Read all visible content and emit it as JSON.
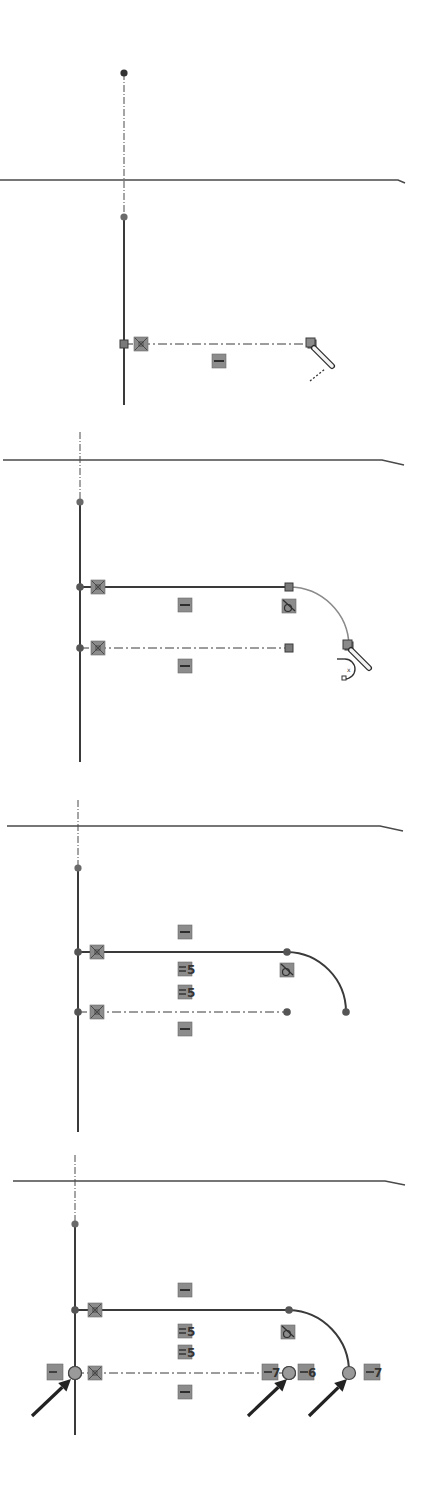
{
  "figure": {
    "colors": {
      "background": "#ffffff",
      "geometry": "#3a3a3a",
      "preview_arc": "#8a8a8a",
      "relation_box_fill": "#8c8c8c",
      "relation_box_stroke": "#6a6a6a",
      "point_fill": "#555555",
      "selected_point_fill": "#9a9a9a",
      "arrow": "#222222"
    }
  },
  "panels": [
    {
      "id": "step-1",
      "horizontal_edge": {
        "x1": 0,
        "y1": 180,
        "x2": 398,
        "y2": 180,
        "tail_x": 405,
        "tail_y": 183
      },
      "centerline": {
        "x": 124,
        "y1": 73,
        "y2": 217
      },
      "top_point": {
        "x": 124,
        "y": 73
      },
      "vertical_line": {
        "x": 124,
        "y1": 217,
        "y2": 405
      },
      "axis_point": {
        "x": 124,
        "y": 217
      },
      "rows": [
        {
          "y": 344,
          "x1": 124,
          "x2": 312,
          "style": "dashdot",
          "start_marker": "square",
          "end_marker": "square",
          "relation_box_x": 141,
          "relation": "coincident"
        }
      ],
      "arc": null,
      "glyphs": [
        {
          "x": 219,
          "y": 361,
          "type": "horizontal",
          "label": ""
        }
      ],
      "cursor": {
        "type": "pencil",
        "x": 312,
        "y": 344,
        "trail": true,
        "arc_hint": false
      }
    },
    {
      "id": "step-2",
      "horizontal_edge": {
        "x1": 3,
        "y1": 460,
        "x2": 382,
        "y2": 460,
        "tail_x": 404,
        "tail_y": 465
      },
      "centerline": {
        "x": 80,
        "y1": 432,
        "y2": 502
      },
      "top_point": null,
      "vertical_line": {
        "x": 80,
        "y1": 502,
        "y2": 762
      },
      "axis_point": {
        "x": 80,
        "y": 502
      },
      "rows": [
        {
          "y": 587,
          "x1": 80,
          "x2": 289,
          "style": "solid",
          "start_marker": "dot",
          "end_marker": "square",
          "relation_box_x": 98,
          "relation": "coincident"
        },
        {
          "y": 648,
          "x1": 80,
          "x2": 289,
          "style": "dashdot",
          "start_marker": "dot",
          "end_marker": "square",
          "relation_box_x": 98,
          "relation": "coincident"
        }
      ],
      "arc": {
        "x1": 289,
        "y1": 587,
        "x2": 349,
        "y2": 646,
        "r": 60,
        "style": "preview",
        "end_marker": "square"
      },
      "glyphs": [
        {
          "x": 185,
          "y": 605,
          "type": "horizontal",
          "label": ""
        },
        {
          "x": 289,
          "y": 606,
          "type": "tangent",
          "label": ""
        },
        {
          "x": 185,
          "y": 666,
          "type": "horizontal",
          "label": ""
        }
      ],
      "cursor": {
        "type": "pencil",
        "x": 349,
        "y": 646,
        "trail": false,
        "arc_hint": true
      }
    },
    {
      "id": "step-3",
      "horizontal_edge": {
        "x1": 7,
        "y1": 826,
        "x2": 380,
        "y2": 826,
        "tail_x": 403,
        "tail_y": 831
      },
      "centerline": {
        "x": 78,
        "y1": 800,
        "y2": 868
      },
      "top_point": null,
      "vertical_line": {
        "x": 78,
        "y1": 868,
        "y2": 1132
      },
      "axis_point": {
        "x": 78,
        "y": 868
      },
      "rows": [
        {
          "y": 952,
          "x1": 78,
          "x2": 287,
          "style": "solid",
          "start_marker": "dot",
          "end_marker": "dot",
          "relation_box_x": 97,
          "relation": "coincident"
        },
        {
          "y": 1012,
          "x1": 78,
          "x2": 287,
          "style": "dashdot",
          "start_marker": "dot",
          "end_marker": "dot",
          "relation_box_x": 97,
          "relation": "coincident"
        }
      ],
      "arc": {
        "x1": 287,
        "y1": 952,
        "x2": 346,
        "y2": 1012,
        "r": 60,
        "style": "solid",
        "end_marker": "dot"
      },
      "glyphs": [
        {
          "x": 185,
          "y": 932,
          "type": "horizontal",
          "label": ""
        },
        {
          "x": 185,
          "y": 969,
          "type": "equal",
          "label": "5"
        },
        {
          "x": 185,
          "y": 992,
          "type": "equal",
          "label": "5"
        },
        {
          "x": 287,
          "y": 970,
          "type": "tangent",
          "label": ""
        },
        {
          "x": 185,
          "y": 1029,
          "type": "horizontal",
          "label": ""
        }
      ],
      "cursor": null
    },
    {
      "id": "step-4",
      "horizontal_edge": {
        "x1": 13,
        "y1": 1181,
        "x2": 385,
        "y2": 1181,
        "tail_x": 405,
        "tail_y": 1185
      },
      "centerline": {
        "x": 75,
        "y1": 1155,
        "y2": 1224
      },
      "top_point": null,
      "vertical_line": {
        "x": 75,
        "y1": 1224,
        "y2": 1435
      },
      "axis_point": {
        "x": 75,
        "y": 1224
      },
      "rows": [
        {
          "y": 1310,
          "x1": 75,
          "x2": 289,
          "style": "solid",
          "start_marker": "dot",
          "end_marker": "dot",
          "relation_box_x": 95,
          "relation": "coincident"
        },
        {
          "y": 1373,
          "x1": 75,
          "x2": 289,
          "style": "dashdot",
          "start_marker": "selected",
          "end_marker": "selected",
          "relation_box_x": 95,
          "relation": "coincident"
        }
      ],
      "arc": {
        "x1": 289,
        "y1": 1310,
        "x2": 349,
        "y2": 1373,
        "r": 62,
        "style": "solid",
        "end_marker": "selected"
      },
      "glyphs": [
        {
          "x": 185,
          "y": 1290,
          "type": "horizontal",
          "label": ""
        },
        {
          "x": 185,
          "y": 1331,
          "type": "equal",
          "label": "5"
        },
        {
          "x": 185,
          "y": 1352,
          "type": "equal",
          "label": "5"
        },
        {
          "x": 288,
          "y": 1332,
          "type": "tangent",
          "label": ""
        },
        {
          "x": 185,
          "y": 1392,
          "type": "horizontal",
          "label": ""
        },
        {
          "x": 55,
          "y": 1372,
          "type": "horizontal-mid",
          "label": ""
        },
        {
          "x": 270,
          "y": 1372,
          "type": "horizontal-mid",
          "label": "7"
        },
        {
          "x": 306,
          "y": 1372,
          "type": "horizontal-mid",
          "label": "6"
        },
        {
          "x": 372,
          "y": 1372,
          "type": "horizontal-mid",
          "label": "7"
        }
      ],
      "arrows": [
        {
          "x1": 32,
          "y1": 1416,
          "x2": 71,
          "y2": 1379
        },
        {
          "x1": 248,
          "y1": 1416,
          "x2": 287,
          "y2": 1379
        },
        {
          "x1": 309,
          "y1": 1416,
          "x2": 347,
          "y2": 1379
        }
      ],
      "cursor": null
    }
  ]
}
